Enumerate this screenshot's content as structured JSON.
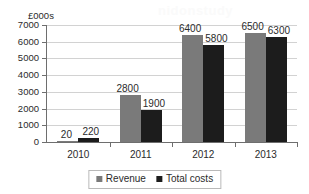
{
  "chart_data": {
    "type": "bar",
    "title": "",
    "subtitle": "",
    "xlabel": "",
    "ylabel": "£000s",
    "categories": [
      "2010",
      "2011",
      "2012",
      "2013"
    ],
    "series": [
      {
        "name": "Revenue",
        "color": "#7a7a7a",
        "values": [
          20,
          2800,
          6400,
          6500
        ]
      },
      {
        "name": "Total costs",
        "color": "#1c1c1c",
        "values": [
          220,
          1900,
          5800,
          6300
        ]
      }
    ],
    "ylim": [
      0,
      7000
    ],
    "ytick_values": [
      0,
      1000,
      2000,
      3000,
      4000,
      5000,
      6000,
      7000
    ],
    "ytick_labels": [
      "0",
      "1000",
      "2000",
      "3000",
      "4000",
      "5000",
      "6000",
      "7000"
    ],
    "grid": true,
    "grid_axis": "y",
    "legend_position": "bottom-center",
    "data_labels": true,
    "data_label_values": [
      [
        "20",
        "220"
      ],
      [
        "2800",
        "1900"
      ],
      [
        "6400",
        "5800"
      ],
      [
        "6500",
        "6300"
      ]
    ]
  },
  "legend": {
    "items": [
      {
        "label": "Revenue",
        "marker": "square-gray-icon"
      },
      {
        "label": "Total costs",
        "marker": "square-black-icon"
      }
    ]
  },
  "artifacts": {
    "watermark_text": "nidonstudy"
  },
  "colors": {
    "revenue": "#7a7a7a",
    "total_costs": "#1c1c1c",
    "axis": "#6e6e6e",
    "gridline": "#d2d2d2",
    "text": "#2b2b2b",
    "background": "#ffffff"
  }
}
